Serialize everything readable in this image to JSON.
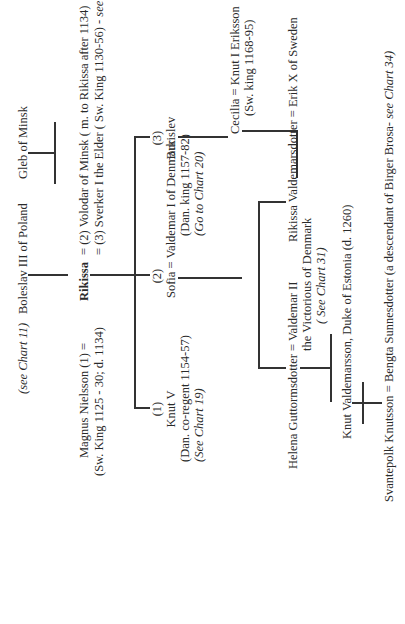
{
  "orientation": "rotated-90-ccw",
  "top_row": {
    "see_chart_11": "(see Chart 11)",
    "boleslav": "Boleslav III of Poland",
    "gleb": "Gleb  of Minsk"
  },
  "marriage_line": {
    "magnus": "Magnus Nielsson  (1)  =",
    "rikissa": "Rikissa",
    "eq2": "=  (2)  Volodar of Minsk  ( m.  to Rikissa after 1134)",
    "magnus_note": "(Sw.  King 1125 - 30; d. 1134)",
    "sverker": "= (3)  Sverker I the Elder  ( Sw. King 1130-56) -",
    "sverker_ref": "see chart 28"
  },
  "children": [
    {
      "number": "(1)",
      "name": "Knut V",
      "note": "(Dan.  co-regent 1154-57)",
      "ref": "(See Chart 19)"
    },
    {
      "number": "(2)",
      "name": "Sofia  = Valdemar I of Denmark",
      "note": "(Dan. king 1157-82)",
      "ref": "(Go to Chart 20)"
    },
    {
      "number": "(3)",
      "name": "Burislev"
    }
  ],
  "cecilia": {
    "name": "Cecilia = Knut I  Eriksson",
    "note": "(Sw.  king 1168-95)"
  },
  "valdemar2": {
    "name": "Helena Guttormsdotter  = Valdemar II",
    "line2": "the Victorious of Denmark",
    "ref": "( See Chart 31)"
  },
  "rikissa_v": {
    "name": "Rikissa  Valdemarsdotter =  Erik X of Sweden"
  },
  "knut_v": {
    "name": "Knut Valdemarsson,  Duke of Estonia  (d. 1260)"
  },
  "svantepolk": {
    "name": "Svantepolk Knutsson = Bengta Sunnesdotter  (a descendant of Birger Brosa-",
    "ref": "see Chart 34)"
  }
}
